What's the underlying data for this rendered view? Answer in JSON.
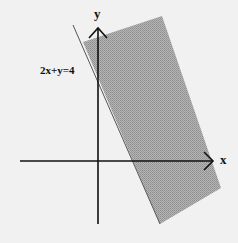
{
  "diagram": {
    "type": "inequality-graph",
    "equation_label": "2x+y=4",
    "axes": {
      "x_label": "x",
      "y_label": "y"
    },
    "shaded_region": "side of line 2x+y=4 away from origin (2x+y ≥ 4)",
    "colors": {
      "shade": "#a8a8a8",
      "axis": "#111111",
      "background": "#f1f1f1"
    }
  }
}
